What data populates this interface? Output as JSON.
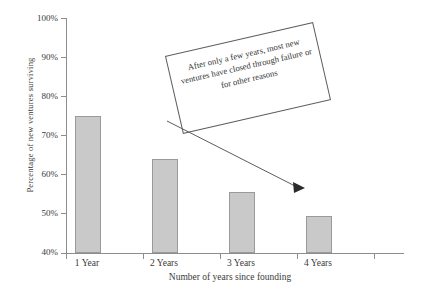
{
  "chart_data": {
    "type": "bar",
    "title": "",
    "xlabel": "Number of years since founding",
    "ylabel": "Percentage of new ventures surviving",
    "categories": [
      "1 Year",
      "2 Years",
      "3 Years",
      "4 Years"
    ],
    "values": [
      75,
      64,
      55.5,
      49.5
    ],
    "ylim": [
      40,
      100
    ],
    "yticks": [
      "40%",
      "50%",
      "60%",
      "70%",
      "80%",
      "90%",
      "100%"
    ],
    "ytick_values": [
      40,
      50,
      60,
      70,
      80,
      90,
      100
    ],
    "grid": false,
    "legend": "none",
    "bar_fill_color": "#c9c9c9",
    "bar_edge_color": "#9a9a9a",
    "axis_color": "#8d8d8d",
    "annotations": [
      {
        "name": "callout-box",
        "text": "After only a few years, most new ventures have closed through failure or for other reasons",
        "rotation_deg": -13,
        "points_to_category": "3 Years"
      }
    ]
  }
}
